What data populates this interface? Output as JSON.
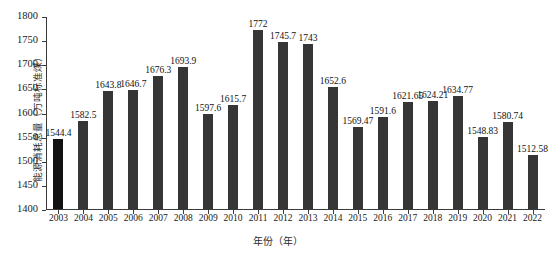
{
  "chart_data": {
    "type": "bar",
    "title": "",
    "subtitle": "",
    "xlabel": "年份（年）",
    "ylabel": "能源消耗总量（万吨标准煤）",
    "ylim": [
      1400,
      1800
    ],
    "yticks": [
      1400,
      1450,
      1500,
      1550,
      1600,
      1650,
      1700,
      1750,
      1800
    ],
    "ytick_labels": [
      "1400",
      "1450",
      "1500",
      "1550",
      "1600",
      "1650",
      "1700",
      "1750",
      "1800"
    ],
    "grid": false,
    "legend": null,
    "legend_position": "none",
    "bar_color": "#363636",
    "first_bar_color": "#121212",
    "categories": [
      "2003",
      "2004",
      "2005",
      "2006",
      "2007",
      "2008",
      "2009",
      "2010",
      "2011",
      "2012",
      "2013",
      "2014",
      "2015",
      "2016",
      "2017",
      "2018",
      "2019",
      "2020",
      "2021",
      "2022"
    ],
    "values": [
      1544.4,
      1582.5,
      1643.8,
      1646.7,
      1676.3,
      1693.9,
      1597.6,
      1615.7,
      1772,
      1745.7,
      1743,
      1652.6,
      1569.47,
      1591.6,
      1621.65,
      1624.21,
      1634.77,
      1548.83,
      1580.74,
      1512.58
    ],
    "value_labels": [
      "1544.4",
      "1582.5",
      "1643.8",
      "1646.7",
      "1676.3",
      "1693.9",
      "1597.6",
      "1615.7",
      "1772",
      "1745.7",
      "1743",
      "1652.6",
      "1569.47",
      "1591.6",
      "1621.65",
      "1624.21",
      "1634.77",
      "1548.83",
      "1580.74",
      "1512.58"
    ]
  }
}
